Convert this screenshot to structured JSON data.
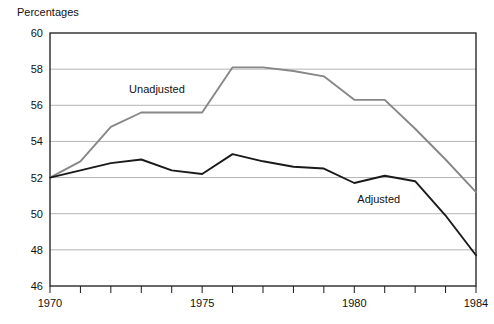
{
  "chart_data": {
    "type": "line",
    "title": "",
    "ylabel": "Percentages",
    "xlabel": "",
    "ylim": [
      46,
      60
    ],
    "xlim": [
      1970,
      1984
    ],
    "y_ticks": [
      46,
      48,
      50,
      52,
      54,
      56,
      58,
      60
    ],
    "y_tick_labels": [
      "46",
      "48",
      "50",
      "52",
      "54",
      "56",
      "58",
      "60"
    ],
    "x_ticks": [
      1970,
      1971,
      1972,
      1973,
      1974,
      1975,
      1976,
      1977,
      1978,
      1979,
      1980,
      1981,
      1982,
      1983,
      1984
    ],
    "x_tick_labels": [
      {
        "value": 1970,
        "label": "1970"
      },
      {
        "value": 1975,
        "label": "1975"
      },
      {
        "value": 1980,
        "label": "1980"
      },
      {
        "value": 1984,
        "label": "1984"
      }
    ],
    "grid": true,
    "grid_axis": "y",
    "legend_position": "inline-annotation",
    "x": [
      1970,
      1971,
      1972,
      1973,
      1974,
      1975,
      1976,
      1977,
      1978,
      1979,
      1980,
      1981,
      1982,
      1983,
      1984
    ],
    "series": [
      {
        "name": "Unadjusted",
        "color": "#878787",
        "values": [
          52.0,
          52.9,
          54.8,
          55.6,
          55.6,
          55.6,
          58.1,
          58.1,
          57.9,
          57.6,
          56.3,
          56.3,
          54.7,
          53.0,
          51.2
        ],
        "label_x": 1972.6,
        "label_y": 56.9
      },
      {
        "name": "Adjusted",
        "color": "#1a1a1a",
        "values": [
          52.0,
          52.4,
          52.8,
          53.0,
          52.4,
          52.2,
          53.3,
          52.9,
          52.6,
          52.5,
          51.7,
          52.1,
          51.8,
          49.9,
          47.7
        ],
        "label_x": 1980.1,
        "label_y": 50.8
      }
    ]
  },
  "plot": {
    "frame_color": "#1a1a1a",
    "gridline_color": "#b4b4b4",
    "background": "#ffffff"
  }
}
